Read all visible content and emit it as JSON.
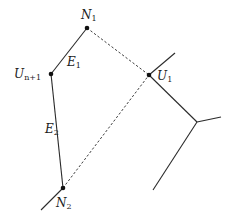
{
  "diagram": {
    "type": "graph",
    "colors": {
      "line": "#2a2a2a",
      "node": "#111111",
      "background": "#ffffff"
    },
    "nodes": [
      {
        "id": "N1",
        "label": "N",
        "subscript": "1",
        "x": 87,
        "y": 28
      },
      {
        "id": "Un1",
        "label": "U",
        "subscript": "n+1",
        "x": 51,
        "y": 74
      },
      {
        "id": "U1",
        "label": "U",
        "subscript": "1",
        "x": 149,
        "y": 75
      },
      {
        "id": "N2",
        "label": "N",
        "subscript": "2",
        "x": 63,
        "y": 188
      }
    ],
    "edges": [
      {
        "id": "E1",
        "from": "N1",
        "to": "Un1",
        "style": "solid",
        "label": "E",
        "subscript": "1"
      },
      {
        "id": "E2",
        "from": "Un1",
        "to": "N2",
        "style": "solid",
        "label": "E",
        "subscript": "2"
      },
      {
        "id": "d1",
        "from": "N1",
        "to": "U1",
        "style": "dashed"
      },
      {
        "id": "d2",
        "from": "N2",
        "to": "U1",
        "style": "dashed"
      }
    ],
    "labels": {
      "n1_main": "N",
      "n1_sub": "1",
      "un1_main": "U",
      "un1_sub": "n+1",
      "u1_main": "U",
      "u1_sub": "1",
      "n2_main": "N",
      "n2_sub": "2",
      "e1_main": "E",
      "e1_sub": "1",
      "e2_main": "E",
      "e2_sub": "2"
    }
  }
}
